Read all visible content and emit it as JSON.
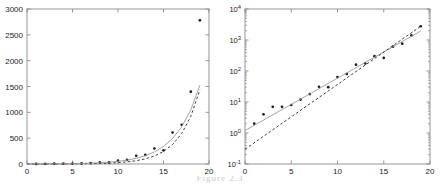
{
  "figure": {
    "caption": "Figure 2.3",
    "panel_count": 2
  },
  "chart_data": [
    {
      "id": "left-panel",
      "type": "scatter",
      "title": "",
      "xlabel": "",
      "ylabel": "",
      "xlim": [
        0,
        20
      ],
      "ylim": [
        0,
        3000
      ],
      "xticks": [
        0,
        5,
        10,
        15,
        20
      ],
      "yticks": [
        0,
        500,
        1000,
        1500,
        2000,
        2500,
        3000
      ],
      "xticklabels": [
        "0",
        "5",
        "10",
        "15",
        "20"
      ],
      "yticklabels": [
        "0",
        "500",
        "1000",
        "1500",
        "2000",
        "2500",
        "3000"
      ],
      "xscale": "linear",
      "yscale": "linear",
      "grid": false,
      "legend": "none",
      "box": true,
      "series": [
        {
          "name": "data-points",
          "type": "scatter",
          "marker": "dot",
          "color": "#1a1a1a",
          "x": [
            1,
            2,
            3,
            4,
            5,
            6,
            7,
            8,
            9,
            10,
            11,
            12,
            13,
            14,
            15,
            16,
            17,
            18,
            19
          ],
          "y": [
            2,
            4,
            7,
            7,
            8,
            12,
            18,
            31,
            30,
            64,
            80,
            160,
            175,
            300,
            265,
            610,
            760,
            1400,
            2780
          ]
        },
        {
          "name": "fitted-dashed-curve",
          "type": "line",
          "style": "dashed",
          "color": "#2b2b2b",
          "x": [
            0,
            1,
            2,
            3,
            4,
            5,
            6,
            7,
            8,
            9,
            10,
            11,
            12,
            13,
            14,
            15,
            16,
            17,
            18,
            19
          ],
          "y": [
            0.3,
            0.47,
            0.74,
            1.15,
            1.8,
            2.81,
            4.39,
            6.85,
            10.7,
            16.7,
            26.1,
            40.7,
            63.6,
            99.3,
            155,
            242,
            378,
            590,
            921,
            1438,
            2246
          ]
        },
        {
          "name": "fitted-solid-curve",
          "type": "line",
          "style": "solid",
          "color": "#9a9a9a",
          "x": [
            0,
            1,
            2,
            3,
            4,
            5,
            6,
            7,
            8,
            9,
            10,
            11,
            12,
            13,
            14,
            15,
            16,
            17,
            18,
            19
          ],
          "y": [
            1.2,
            1.75,
            2.55,
            3.71,
            5.41,
            7.88,
            11.5,
            16.7,
            24.4,
            35.5,
            51.7,
            75.3,
            110,
            160,
            233,
            339,
            494,
            719,
            1047,
            1525,
            1950
          ]
        }
      ]
    },
    {
      "id": "right-panel",
      "type": "line",
      "title": "",
      "xlabel": "",
      "ylabel": "",
      "xlim": [
        0,
        20
      ],
      "ylim": [
        0.1,
        10000
      ],
      "xticks": [
        0,
        5,
        10,
        15,
        20
      ],
      "yticks": [
        0.1,
        1,
        10,
        100,
        1000,
        10000
      ],
      "xticklabels": [
        "0",
        "5",
        "10",
        "15",
        "20"
      ],
      "yticklabels": [
        "10^-1",
        "10^0",
        "10^1",
        "10^2",
        "10^3",
        "10^4"
      ],
      "xscale": "linear",
      "yscale": "log",
      "grid": false,
      "legend": "none",
      "box": true,
      "series": [
        {
          "name": "data-points",
          "type": "scatter",
          "marker": "dot",
          "color": "#1a1a1a",
          "x": [
            1,
            2,
            3,
            4,
            5,
            6,
            7,
            8,
            9,
            10,
            11,
            12,
            13,
            14,
            15,
            16,
            17,
            18,
            19
          ],
          "y": [
            2,
            4,
            7,
            7,
            8,
            12,
            18,
            31,
            30,
            64,
            80,
            160,
            175,
            300,
            265,
            610,
            760,
            1400,
            2780
          ]
        },
        {
          "name": "fitted-solid-line",
          "type": "line",
          "style": "solid",
          "color": "#9a9a9a",
          "x": [
            0,
            19
          ],
          "y": [
            1.2,
            1950
          ]
        },
        {
          "name": "fitted-dashed-line",
          "type": "line",
          "style": "dashed",
          "color": "#2b2b2b",
          "x": [
            0,
            19
          ],
          "y": [
            0.3,
            2780
          ]
        }
      ]
    }
  ]
}
